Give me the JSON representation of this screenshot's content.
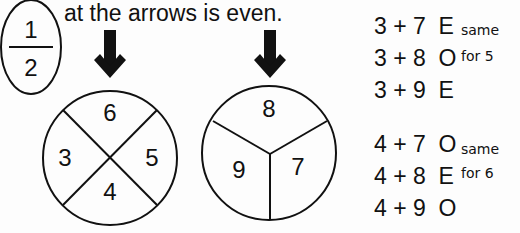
{
  "fraction": {
    "numerator": "1",
    "denominator": "2"
  },
  "title": "at the arrows is even.",
  "spinner_left": {
    "labels": [
      "6",
      "5",
      "4",
      "3"
    ]
  },
  "spinner_right": {
    "labels": [
      "8",
      "7",
      "9"
    ]
  },
  "equations": [
    {
      "expr": "3 + 7",
      "result": "E"
    },
    {
      "expr": "3 + 8",
      "result": "O"
    },
    {
      "expr": "3 + 9",
      "result": "E"
    },
    {
      "expr": "4 + 7",
      "result": "O"
    },
    {
      "expr": "4 + 8",
      "result": "E"
    },
    {
      "expr": "4 + 9",
      "result": "O"
    }
  ],
  "notes": [
    {
      "line1": "same",
      "line2": "for 5"
    },
    {
      "line1": "same",
      "line2": "for 6"
    }
  ]
}
